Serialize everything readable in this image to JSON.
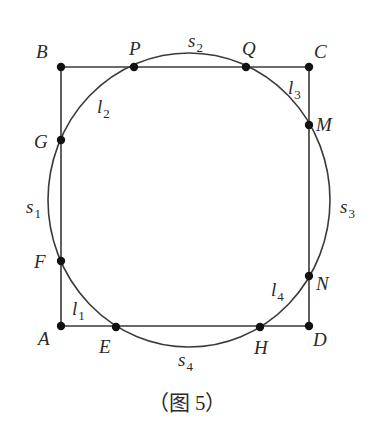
{
  "figure": {
    "caption": "（图 5）",
    "colors": {
      "stroke": "#3a3a3a",
      "point": "#111111",
      "text": "#2a2a2a"
    },
    "rectangle": {
      "A": [
        61,
        326
      ],
      "B": [
        61,
        67
      ],
      "C": [
        309,
        67
      ],
      "D": [
        309,
        326
      ]
    },
    "curve": {
      "type": "ellipse",
      "cx": 189,
      "cy": 200,
      "rx": 141,
      "ry": 147
    },
    "points": [
      {
        "name": "A",
        "x": 61,
        "y": 326,
        "label_x": 38,
        "label_y": 345
      },
      {
        "name": "B",
        "x": 61,
        "y": 67,
        "label_x": 36,
        "label_y": 58
      },
      {
        "name": "C",
        "x": 309,
        "y": 67,
        "label_x": 314,
        "label_y": 58
      },
      {
        "name": "D",
        "x": 309,
        "y": 326,
        "label_x": 313,
        "label_y": 346
      },
      {
        "name": "P",
        "x": 134,
        "y": 67,
        "label_x": 129,
        "label_y": 55
      },
      {
        "name": "Q",
        "x": 246,
        "y": 67,
        "label_x": 242,
        "label_y": 55
      },
      {
        "name": "G",
        "x": 61,
        "y": 140,
        "label_x": 34,
        "label_y": 148
      },
      {
        "name": "F",
        "x": 61,
        "y": 261,
        "label_x": 34,
        "label_y": 268
      },
      {
        "name": "M",
        "x": 309,
        "y": 125,
        "label_x": 316,
        "label_y": 131
      },
      {
        "name": "N",
        "x": 309,
        "y": 276,
        "label_x": 316,
        "label_y": 290
      },
      {
        "name": "E",
        "x": 116,
        "y": 327,
        "label_x": 99,
        "label_y": 353
      },
      {
        "name": "H",
        "x": 260,
        "y": 327,
        "label_x": 254,
        "label_y": 354
      }
    ],
    "labels": [
      {
        "id": "l1",
        "base": "l",
        "sub": "1",
        "x": 72,
        "y": 315
      },
      {
        "id": "l2",
        "base": "l",
        "sub": "2",
        "x": 97,
        "y": 113
      },
      {
        "id": "l3",
        "base": "l",
        "sub": "3",
        "x": 288,
        "y": 94
      },
      {
        "id": "l4",
        "base": "l",
        "sub": "4",
        "x": 271,
        "y": 296
      },
      {
        "id": "s1",
        "base": "s",
        "sub": "1",
        "x": 26,
        "y": 213
      },
      {
        "id": "s2",
        "base": "s",
        "sub": "2",
        "x": 188,
        "y": 47
      },
      {
        "id": "s3",
        "base": "s",
        "sub": "3",
        "x": 340,
        "y": 213
      },
      {
        "id": "s4",
        "base": "s",
        "sub": "4",
        "x": 178,
        "y": 366
      }
    ]
  }
}
